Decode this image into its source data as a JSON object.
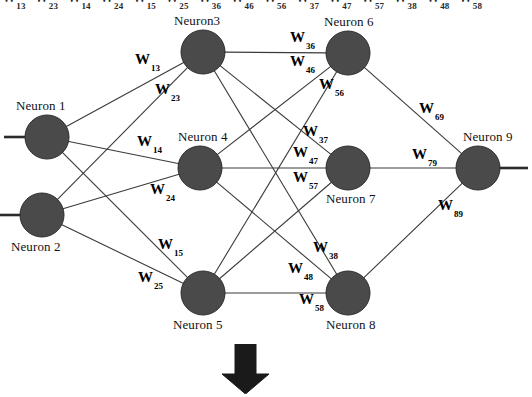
{
  "diagram": {
    "colors": {
      "node_fill": "#4a4a4a",
      "edge": "#3a3a3a",
      "text": "#000000",
      "background": "#ffffff",
      "arrow": "#1a1a1a"
    },
    "nodes": [
      {
        "id": "n1",
        "label": "Neuron 1",
        "cx": 47,
        "cy": 137,
        "r": 22,
        "label_x": 16,
        "label_y": 98,
        "layer": "input"
      },
      {
        "id": "n2",
        "label": "Neuron 2",
        "cx": 42,
        "cy": 215,
        "r": 22,
        "label_x": 11,
        "label_y": 239,
        "layer": "input"
      },
      {
        "id": "n3",
        "label": "Neuron3",
        "cx": 203,
        "cy": 52,
        "r": 22,
        "label_x": 174,
        "label_y": 13,
        "layer": "hidden1"
      },
      {
        "id": "n4",
        "label": "Neuron 4",
        "cx": 200,
        "cy": 168,
        "r": 22,
        "label_x": 178,
        "label_y": 129,
        "layer": "hidden1"
      },
      {
        "id": "n5",
        "label": "Neuron 5",
        "cx": 203,
        "cy": 293,
        "r": 22,
        "label_x": 173,
        "label_y": 317,
        "layer": "hidden1"
      },
      {
        "id": "n6",
        "label": "Neuron 6",
        "cx": 348,
        "cy": 53,
        "r": 22,
        "label_x": 324,
        "label_y": 14,
        "layer": "hidden2"
      },
      {
        "id": "n7",
        "label": "Neuron 7",
        "cx": 348,
        "cy": 168,
        "r": 22,
        "label_x": 326,
        "label_y": 191,
        "layer": "hidden2"
      },
      {
        "id": "n8",
        "label": "Neuron 8",
        "cx": 348,
        "cy": 293,
        "r": 22,
        "label_x": 326,
        "label_y": 317,
        "layer": "hidden2"
      },
      {
        "id": "n9",
        "label": "Neuron 9",
        "cx": 478,
        "cy": 168,
        "r": 22,
        "label_x": 463,
        "label_y": 129,
        "layer": "output"
      }
    ],
    "edges": [
      {
        "from": "n1",
        "to": "n3",
        "weight": "W13"
      },
      {
        "from": "n1",
        "to": "n4",
        "weight": "W14"
      },
      {
        "from": "n1",
        "to": "n5",
        "weight": "W15"
      },
      {
        "from": "n2",
        "to": "n3",
        "weight": "W23"
      },
      {
        "from": "n2",
        "to": "n4",
        "weight": "W24"
      },
      {
        "from": "n2",
        "to": "n5",
        "weight": "W25"
      },
      {
        "from": "n3",
        "to": "n6",
        "weight": "W36"
      },
      {
        "from": "n3",
        "to": "n7",
        "weight": "W37"
      },
      {
        "from": "n3",
        "to": "n8",
        "weight": "W38"
      },
      {
        "from": "n4",
        "to": "n6",
        "weight": "W46"
      },
      {
        "from": "n4",
        "to": "n7",
        "weight": "W47"
      },
      {
        "from": "n4",
        "to": "n8",
        "weight": "W48"
      },
      {
        "from": "n5",
        "to": "n6",
        "weight": "W56"
      },
      {
        "from": "n5",
        "to": "n7",
        "weight": "W57"
      },
      {
        "from": "n5",
        "to": "n8",
        "weight": "W58"
      },
      {
        "from": "n6",
        "to": "n9",
        "weight": "W69"
      },
      {
        "from": "n7",
        "to": "n9",
        "weight": "W79"
      },
      {
        "from": "n8",
        "to": "n9",
        "weight": "W89"
      }
    ],
    "weight_labels": [
      {
        "id": "w13",
        "base": "W",
        "sub": "13",
        "x": 135,
        "y": 52
      },
      {
        "id": "w23",
        "base": "W",
        "sub": "23",
        "x": 155,
        "y": 82
      },
      {
        "id": "w14",
        "base": "W",
        "sub": "14",
        "x": 137,
        "y": 134
      },
      {
        "id": "w24",
        "base": "W",
        "sub": "24",
        "x": 150,
        "y": 182
      },
      {
        "id": "w15",
        "base": "W",
        "sub": "15",
        "x": 158,
        "y": 237
      },
      {
        "id": "w25",
        "base": "W",
        "sub": "25",
        "x": 138,
        "y": 270
      },
      {
        "id": "w36",
        "base": "W",
        "sub": "36",
        "x": 290,
        "y": 30
      },
      {
        "id": "w46",
        "base": "W",
        "sub": "46",
        "x": 290,
        "y": 54
      },
      {
        "id": "w56",
        "base": "W",
        "sub": "56",
        "x": 319,
        "y": 77
      },
      {
        "id": "w37",
        "base": "W",
        "sub": "37",
        "x": 303,
        "y": 124
      },
      {
        "id": "w47",
        "base": "W",
        "sub": "47",
        "x": 293,
        "y": 145
      },
      {
        "id": "w57",
        "base": "W",
        "sub": "57",
        "x": 293,
        "y": 170
      },
      {
        "id": "w38",
        "base": "W",
        "sub": "38",
        "x": 313,
        "y": 240
      },
      {
        "id": "w48",
        "base": "W",
        "sub": "48",
        "x": 288,
        "y": 261
      },
      {
        "id": "w58",
        "base": "W",
        "sub": "58",
        "x": 299,
        "y": 292
      },
      {
        "id": "w69",
        "base": "W",
        "sub": "69",
        "x": 419,
        "y": 101
      },
      {
        "id": "w79",
        "base": "W",
        "sub": "79",
        "x": 412,
        "y": 147
      },
      {
        "id": "w89",
        "base": "W",
        "sub": "89",
        "x": 438,
        "y": 198
      }
    ],
    "top_strip_labels": [
      {
        "base": "W",
        "sub": "13"
      },
      {
        "base": "W",
        "sub": "23"
      },
      {
        "base": "W",
        "sub": "14"
      },
      {
        "base": "W",
        "sub": "24"
      },
      {
        "base": "W",
        "sub": "15"
      },
      {
        "base": "W",
        "sub": "25"
      },
      {
        "base": "W",
        "sub": "36"
      },
      {
        "base": "W",
        "sub": "46"
      },
      {
        "base": "W",
        "sub": "56"
      },
      {
        "base": "W",
        "sub": "37"
      },
      {
        "base": "W",
        "sub": "47"
      },
      {
        "base": "W",
        "sub": "57"
      },
      {
        "base": "W",
        "sub": "38"
      },
      {
        "base": "W",
        "sub": "48"
      },
      {
        "base": "W",
        "sub": "58"
      }
    ],
    "io_stubs": [
      {
        "id": "input-stub-1",
        "x1": 4,
        "y1": 137,
        "x2": 26,
        "y2": 137
      },
      {
        "id": "input-stub-2",
        "x1": 0,
        "y1": 215,
        "x2": 21,
        "y2": 215
      },
      {
        "id": "output-stub-9",
        "x1": 499,
        "y1": 168,
        "x2": 528,
        "y2": 168
      }
    ],
    "arrow": {
      "name": "down-arrow",
      "x": 221,
      "y": 344,
      "width": 49,
      "height": 50
    }
  }
}
